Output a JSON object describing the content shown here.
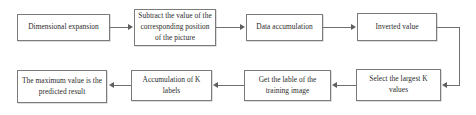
{
  "diagram": {
    "type": "flowchart",
    "title": "",
    "orientation": "snake-two-rows",
    "colors": {
      "box_border": "#7b7b7b",
      "box_fill": "#ffffff",
      "connector": "#6f6f6f",
      "arrowhead": "#5e5e5e",
      "text": "#2b2b2b",
      "background": "#ffffff"
    },
    "nodes": [
      {
        "id": "n1",
        "label": "Dimensional expansion",
        "row": "top",
        "order": 1
      },
      {
        "id": "n2",
        "label": "Subtract the value of the corresponding position of the picture",
        "row": "top",
        "order": 2
      },
      {
        "id": "n3",
        "label": "Data accumulation",
        "row": "top",
        "order": 3
      },
      {
        "id": "n4",
        "label": "Inverted value",
        "row": "top",
        "order": 4
      },
      {
        "id": "n5",
        "label": "Select the largest K values",
        "row": "bottom",
        "order": 5
      },
      {
        "id": "n6",
        "label": "Get the lable of the training image",
        "row": "bottom",
        "order": 6
      },
      {
        "id": "n7",
        "label": "Accumulation of K labels",
        "row": "bottom",
        "order": 7
      },
      {
        "id": "n8",
        "label": "The maximum value is the predicted result",
        "row": "bottom",
        "order": 8
      }
    ],
    "edges": [
      {
        "from": "n1",
        "to": "n2",
        "direction": "right"
      },
      {
        "from": "n2",
        "to": "n3",
        "direction": "right"
      },
      {
        "from": "n3",
        "to": "n4",
        "direction": "right"
      },
      {
        "from": "n4",
        "to": "n5",
        "direction": "wrap-right-down-left"
      },
      {
        "from": "n5",
        "to": "n6",
        "direction": "left"
      },
      {
        "from": "n6",
        "to": "n7",
        "direction": "left"
      },
      {
        "from": "n7",
        "to": "n8",
        "direction": "left"
      }
    ]
  }
}
